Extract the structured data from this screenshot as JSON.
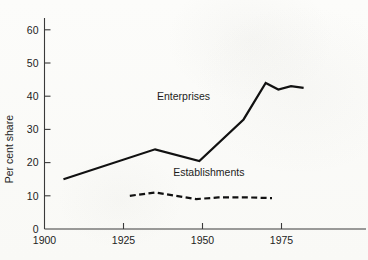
{
  "chart_data": {
    "type": "line",
    "title": "",
    "subtitle": "",
    "xlabel": "",
    "ylabel": "Per cent share",
    "xlim": [
      1900,
      1985
    ],
    "ylim": [
      0,
      65
    ],
    "grid": false,
    "legend_position": "inline-annotation",
    "x_ticks": [
      1900,
      1925,
      1950,
      1975
    ],
    "x_tick_labels": [
      "1900",
      "1925",
      "1950",
      "1975"
    ],
    "y_ticks": [
      0,
      10,
      20,
      30,
      40,
      50,
      60
    ],
    "y_tick_labels": [
      "0",
      "10",
      "20",
      "30",
      "40",
      "50",
      "60"
    ],
    "series": [
      {
        "name": "Enterprises",
        "style": "solid",
        "color": "#111111",
        "label_x": 1944,
        "label_y": 39,
        "x": [
          1906,
          1935,
          1949,
          1963,
          1970,
          1974,
          1978,
          1982
        ],
        "values": [
          15,
          24,
          20.5,
          33,
          44,
          42,
          43,
          42.5
        ]
      },
      {
        "name": "Establishments",
        "style": "dashed",
        "color": "#111111",
        "label_x": 1952,
        "label_y": 16,
        "x": [
          1927,
          1935,
          1948,
          1955,
          1965,
          1972
        ],
        "values": [
          10,
          11,
          9,
          9.5,
          9.5,
          9.3
        ]
      }
    ]
  },
  "annotations": {
    "enterprises_label": "Enterprises",
    "establishments_label": "Establishments"
  }
}
